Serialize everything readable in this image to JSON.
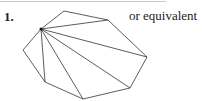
{
  "question": {
    "number": "1.",
    "note": "or equivalent"
  },
  "diagram": {
    "type": "polygon-triangulation",
    "stroke_color": "#333333",
    "vertices": [
      [
        41,
        29
      ],
      [
        64,
        11
      ],
      [
        108,
        20
      ],
      [
        147,
        57
      ],
      [
        130,
        88
      ],
      [
        83,
        99
      ],
      [
        45,
        82
      ],
      [
        23,
        50
      ]
    ],
    "apex_index": 0
  }
}
